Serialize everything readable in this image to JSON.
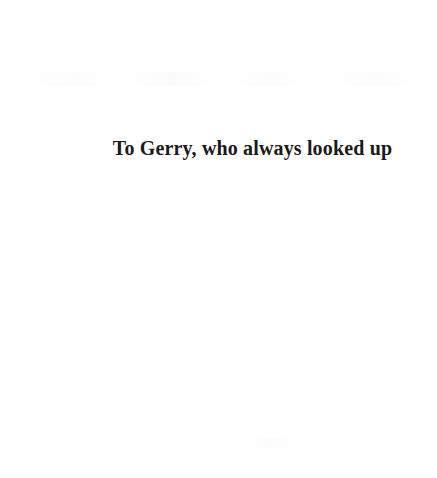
{
  "document": {
    "type": "book-dedication-page",
    "page_background_color": "#ffffff",
    "ink_color": "#1a1a1a"
  },
  "dedication": {
    "text": "To Gerry, who always looked up"
  }
}
